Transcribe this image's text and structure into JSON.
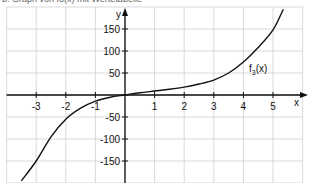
{
  "caption": "b. Graph von f3(x) mit Wertetabelle",
  "chart_data": {
    "type": "line",
    "title": "",
    "xlabel": "x",
    "ylabel": "y",
    "xlim": [
      -4,
      6
    ],
    "ylim": [
      -200,
      200
    ],
    "grid": true,
    "x_ticks": [
      -3,
      -2,
      -1,
      1,
      2,
      3,
      4,
      5
    ],
    "y_ticks": [
      150,
      100,
      50,
      -50,
      -100,
      -150
    ],
    "x_tick_labels": [
      "-3",
      "-2",
      "-1",
      "1",
      "2",
      "3",
      "4",
      "5"
    ],
    "y_tick_labels": [
      "150",
      "100",
      "50",
      "-50",
      "-100",
      "-150"
    ],
    "series": [
      {
        "name": "f3(x)",
        "annotation": "f3(x)",
        "x": [
          -3.5,
          -3,
          -2.5,
          -2,
          -1.5,
          -1,
          -0.5,
          0,
          0.5,
          1,
          1.5,
          2,
          2.5,
          3,
          3.5,
          4,
          4.5,
          5,
          5.35
        ],
        "y": [
          -195,
          -150,
          -95,
          -55,
          -30,
          -14,
          -5,
          0,
          5,
          9,
          13,
          18,
          25,
          34,
          50,
          75,
          108,
          148,
          195
        ]
      }
    ],
    "colors": {
      "curve": "#111111",
      "axis": "#111111",
      "grid": "#cfcfcf"
    }
  }
}
